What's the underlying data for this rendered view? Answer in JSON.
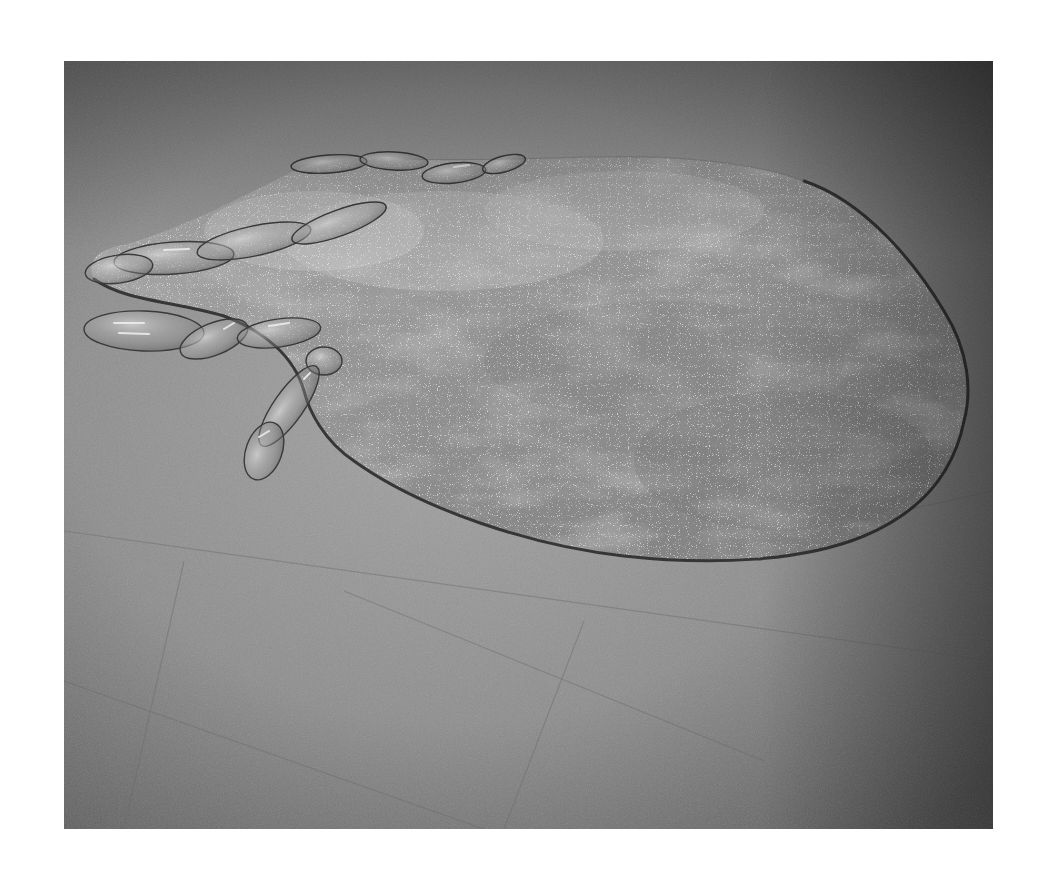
{
  "image": {
    "type": "photograph",
    "color_mode": "grayscale",
    "frame": {
      "x": 64,
      "y": 61,
      "width": 929,
      "height": 768
    },
    "background_color": "#ffffff",
    "alt": "Black-and-white photograph of a floor sculpture: a large flat irregular pool-like shape of speckled glittering material outlined by a dark line, with clear blown-glass elongated bubble forms along its left edge, resting on a gray terrazzo floor."
  },
  "palette": {
    "floor_light": "#9a9a9a",
    "floor_mid": "#858585",
    "floor_dark": "#4e4e4e",
    "pool_base": "#8f8f8f",
    "pool_light": "#b4b4b4",
    "pool_dark": "#747474",
    "outline": "#2a2a2a",
    "glass_highlight": "#e8e8e8"
  },
  "scene": {
    "subject": "floor-installation-pool-shape",
    "elements": [
      "floor",
      "pool-shape",
      "pool-outline",
      "glass-bubbles",
      "floor-seams",
      "vignette"
    ]
  }
}
